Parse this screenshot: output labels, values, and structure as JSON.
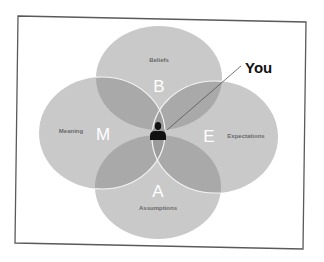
{
  "diagram": {
    "pointer_label": "You",
    "center_icon": "person-icon",
    "circles": [
      {
        "id": "beliefs",
        "letter": "B",
        "label": "Beliefs"
      },
      {
        "id": "meaning",
        "letter": "M",
        "label": "Meaning"
      },
      {
        "id": "expectations",
        "letter": "E",
        "label": "Expectations"
      },
      {
        "id": "assumptions",
        "letter": "A",
        "label": "Assumptions"
      }
    ],
    "colors": {
      "circle_fill": "#c8c8c8",
      "overlap_fill": "#a8a8a8",
      "circle_stroke": "#ffffff",
      "frame_stroke": "#555555",
      "icon": "#111111"
    }
  }
}
